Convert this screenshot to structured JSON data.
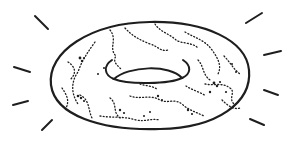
{
  "illustration": {
    "subject": "donut",
    "description": "Hand-drawn sketch of a donut with speckled sprinkle texture and radiating emphasis lines",
    "icon": "donut-icon",
    "stroke_color": "#1e1e1e",
    "background_color": "#ffffff"
  }
}
